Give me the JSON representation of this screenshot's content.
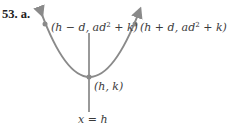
{
  "problem": {
    "number": "53.",
    "part": "a."
  },
  "diagram": {
    "type": "parabola",
    "curve_color": "#8a8a8a",
    "axis_color": "#555555",
    "points": [
      {
        "id": "left-point",
        "label_pre": "(h − d, ad",
        "label_sup": "2",
        "label_post": " + k)"
      },
      {
        "id": "right-point",
        "label_pre": "(h + d, ad",
        "label_sup": "2",
        "label_post": " + k)"
      },
      {
        "id": "vertex",
        "label": "(h, k)"
      }
    ],
    "axis_label": "x = h"
  }
}
